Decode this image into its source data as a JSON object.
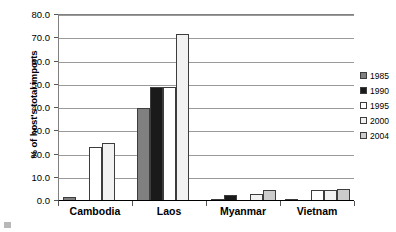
{
  "chart_data": {
    "type": "bar",
    "title": "",
    "xlabel": "",
    "ylabel": "% of host's total imports",
    "ylim": [
      0,
      80
    ],
    "ytick_step": 10,
    "ytick_labels": [
      "0.0",
      "10.0",
      "20.0",
      "30.0",
      "40.0",
      "50.0",
      "60.0",
      "70.0",
      "80.0"
    ],
    "grid": true,
    "legend_position": "right",
    "categories": [
      "Cambodia",
      "Laos",
      "Myanmar",
      "Vietnam"
    ],
    "series": [
      {
        "name": "1985",
        "color": "#808080",
        "values": [
          1.5,
          39.5,
          0.3,
          0.4
        ]
      },
      {
        "name": "1990",
        "color": "#1a1a1a",
        "values": [
          0.0,
          48.5,
          2.2,
          0.0
        ]
      },
      {
        "name": "1995",
        "color": "#ffffff",
        "values": [
          22.8,
          48.5,
          0.0,
          4.2
        ]
      },
      {
        "name": "2000",
        "color": "#f2f2f2",
        "values": [
          24.5,
          71.5,
          2.5,
          4.2
        ]
      },
      {
        "name": "2004",
        "color": "#cccccc",
        "values": [
          0.0,
          0.0,
          4.1,
          4.8
        ]
      }
    ]
  },
  "legend": {
    "items": [
      {
        "label": "1985"
      },
      {
        "label": "1990"
      },
      {
        "label": "1995"
      },
      {
        "label": "2000"
      },
      {
        "label": "2004"
      }
    ]
  }
}
